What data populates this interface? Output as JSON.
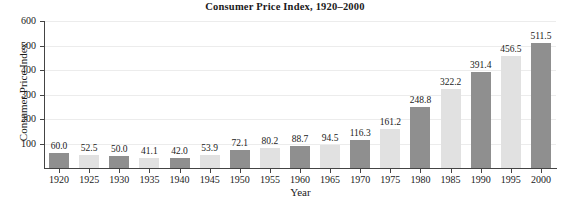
{
  "chart_data": {
    "type": "bar",
    "title": "Consumer Price Index, 1920–2000",
    "xlabel": "Year",
    "ylabel": "Consumer Price Index",
    "categories": [
      "1920",
      "1925",
      "1930",
      "1935",
      "1940",
      "1945",
      "1950",
      "1955",
      "1960",
      "1965",
      "1970",
      "1975",
      "1980",
      "1985",
      "1990",
      "1995",
      "2000"
    ],
    "values": [
      60.0,
      52.5,
      50.0,
      41.1,
      42.0,
      53.9,
      72.1,
      80.2,
      88.7,
      94.5,
      116.3,
      161.2,
      248.8,
      322.2,
      391.4,
      456.5,
      511.5
    ],
    "value_labels": [
      "60.0",
      "52.5",
      "50.0",
      "41.1",
      "42.0",
      "53.9",
      "72.1",
      "80.2",
      "88.7",
      "94.5",
      "116.3",
      "161.2",
      "248.8",
      "322.2",
      "391.4",
      "456.5",
      "511.5"
    ],
    "ylim": [
      0,
      600
    ],
    "yticks": [
      100,
      200,
      300,
      400,
      500,
      600
    ],
    "ytick_labels": [
      "100",
      "200",
      "300",
      "400",
      "500",
      "600"
    ],
    "grid": true,
    "legend": "none",
    "bar_colors": [
      "#8f8f8f",
      "#e1e1e1"
    ],
    "series": [
      {
        "name": "Consumer Price Index",
        "values": [
          60.0,
          52.5,
          50.0,
          41.1,
          42.0,
          53.9,
          72.1,
          80.2,
          88.7,
          94.5,
          116.3,
          161.2,
          248.8,
          322.2,
          391.4,
          456.5,
          511.5
        ]
      }
    ]
  }
}
